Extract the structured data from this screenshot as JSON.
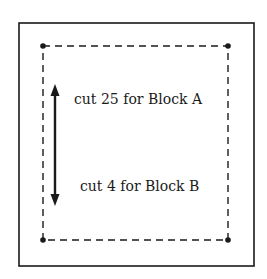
{
  "diagram": {
    "outer_square": {
      "x": 19,
      "y": 23,
      "width": 235,
      "height": 243,
      "stroke": "#1a1a1a"
    },
    "seam_line": {
      "style": "dashed",
      "corners": [
        {
          "name": "top-left",
          "x": 43,
          "y": 46
        },
        {
          "name": "top-right",
          "x": 228,
          "y": 46
        },
        {
          "name": "bottom-right",
          "x": 228,
          "y": 240
        },
        {
          "name": "bottom-left",
          "x": 43,
          "y": 240
        }
      ]
    },
    "grain_arrow": {
      "x": 55,
      "y_top": 84,
      "y_bottom": 206,
      "direction": "both"
    },
    "labels": [
      {
        "text": "cut 25 for Block A",
        "x": 74,
        "y": 104
      },
      {
        "text": "cut 4 for Block B",
        "x": 80,
        "y": 191
      }
    ],
    "colors": {
      "ink": "#1a1a1a",
      "background": "#ffffff"
    }
  }
}
